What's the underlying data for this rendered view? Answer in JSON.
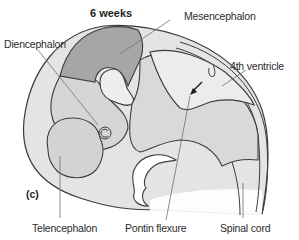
{
  "figure": {
    "title": "6 weeks",
    "panel_label": "(c)",
    "colors": {
      "outline": "#3c3c3c",
      "mesencephalon_fill": "#a6a6a6",
      "brain_fill": "#d9d9d9",
      "ventricle_fill": "#ececec",
      "light_fill": "#f2f2f2",
      "leader_line": "#6e6e6e",
      "background": "#ffffff"
    }
  },
  "labels": {
    "diencephalon": "Diencephalon",
    "mesencephalon": "Mesencephalon",
    "fourth_ventricle": "4th ventricle",
    "telencephalon": "Telencephalon",
    "pontine_flexure": "Pontin flexure",
    "spinal_cord": "Spinal cord"
  }
}
